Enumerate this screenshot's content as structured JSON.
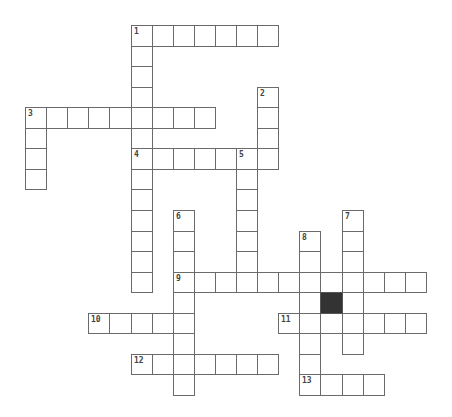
{
  "puzzle": {
    "grid": {
      "origin_x": 25,
      "origin_y": 25,
      "cell_w": 21.1,
      "cell_h": 20.55,
      "border_color": "#6a6a6a",
      "block_color": "#333333"
    },
    "words": [
      {
        "number": "1",
        "direction": "across",
        "row": 0,
        "col": 5,
        "length": 7
      },
      {
        "number": "1",
        "direction": "down",
        "row": 0,
        "col": 5,
        "length": 13
      },
      {
        "number": "2",
        "direction": "down",
        "row": 3,
        "col": 11,
        "length": 4
      },
      {
        "number": "3",
        "direction": "across",
        "row": 4,
        "col": 0,
        "length": 9
      },
      {
        "number": "3",
        "direction": "down",
        "row": 4,
        "col": 0,
        "length": 4
      },
      {
        "number": "4",
        "direction": "across",
        "row": 6,
        "col": 5,
        "length": 7
      },
      {
        "number": "5",
        "direction": "down",
        "row": 6,
        "col": 10,
        "length": 7
      },
      {
        "number": "6",
        "direction": "down",
        "row": 9,
        "col": 7,
        "length": 9
      },
      {
        "number": "7",
        "direction": "down",
        "row": 9,
        "col": 15,
        "length": 7
      },
      {
        "number": "8",
        "direction": "down",
        "row": 10,
        "col": 13,
        "length": 8
      },
      {
        "number": "9",
        "direction": "across",
        "row": 12,
        "col": 7,
        "length": 12
      },
      {
        "number": "10",
        "direction": "across",
        "row": 14,
        "col": 3,
        "length": 5
      },
      {
        "number": "11",
        "direction": "across",
        "row": 14,
        "col": 12,
        "length": 7
      },
      {
        "number": "12",
        "direction": "across",
        "row": 16,
        "col": 5,
        "length": 7
      },
      {
        "number": "13",
        "direction": "across",
        "row": 17,
        "col": 13,
        "length": 4
      }
    ],
    "blocks": [
      {
        "row": 13,
        "col": 14
      }
    ]
  }
}
